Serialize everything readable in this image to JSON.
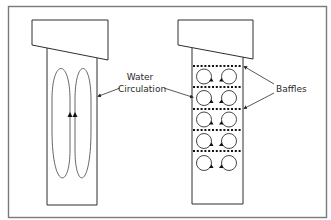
{
  "diagram": {
    "colors": {
      "frame": "#7a7a7a",
      "stroke": "#2e2e2e",
      "loop": "#555555",
      "background": "#ffffff"
    },
    "left_tank": {
      "description": "Unbaffled tank with large vertical circulation loops",
      "label_line1": "Water",
      "label_line2": "Circulation"
    },
    "right_tank": {
      "description": "Baffled tank with small circulation cells between baffles",
      "baffle_count": 5,
      "cell_rows": 5,
      "cells_per_row": 2,
      "label": "Baffles"
    }
  }
}
